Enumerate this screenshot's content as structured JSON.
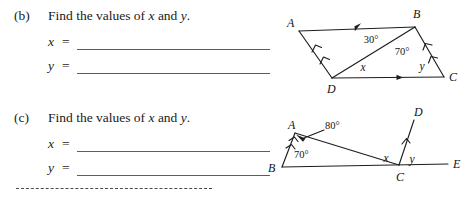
{
  "worksheet": {
    "questions": [
      {
        "id": "b",
        "label": "(b)",
        "prompt_before": "Find the values of ",
        "prompt_var1": "x",
        "prompt_mid": " and ",
        "prompt_var2": "y",
        "prompt_end": ".",
        "answers": [
          {
            "var": "x",
            "equals": "=",
            "value": ""
          },
          {
            "var": "y",
            "equals": "=",
            "value": ""
          }
        ]
      },
      {
        "id": "c",
        "label": "(c)",
        "prompt_before": "Find the values of ",
        "prompt_var1": "x",
        "prompt_mid": " and ",
        "prompt_var2": "y",
        "prompt_end": ".",
        "answers": [
          {
            "var": "x",
            "equals": "=",
            "value": ""
          },
          {
            "var": "y",
            "equals": "=",
            "value": ""
          }
        ]
      }
    ],
    "separator": "dashed-rule"
  },
  "figures": {
    "parallelogram": {
      "name": "parallelogram-abcd-with-diagonal",
      "vertices": [
        {
          "name": "A",
          "label": "A",
          "x": 22,
          "y": 30
        },
        {
          "name": "B",
          "label": "B",
          "x": 138,
          "y": 26
        },
        {
          "name": "C",
          "label": "C",
          "x": 170,
          "y": 76
        },
        {
          "name": "D",
          "label": "D",
          "x": 55,
          "y": 78
        }
      ],
      "angles": [
        {
          "name": "angle-dbа-30",
          "label": "30°",
          "x": 92,
          "y": 44
        },
        {
          "name": "angle-dbc-70",
          "label": "70°",
          "x": 117,
          "y": 52
        }
      ],
      "unknowns": [
        {
          "name": "angle-x",
          "label": "x",
          "x": 87,
          "y": 69
        },
        {
          "name": "angle-y",
          "label": "y",
          "x": 146,
          "y": 68
        }
      ],
      "tickmarks": {
        "ab_single_arrow": 1,
        "dc_single_arrow": 1,
        "ad_double_arrow": 2,
        "bc_double_arrow": 2
      }
    },
    "triangle_line": {
      "name": "triangle-abc-with-ray-cd-on-line-be",
      "vertices": [
        {
          "name": "A",
          "label": "A",
          "x": 30,
          "y": 28
        },
        {
          "name": "B",
          "label": "B",
          "x": 19,
          "y": 72
        },
        {
          "name": "C",
          "label": "C",
          "x": 137,
          "y": 80
        },
        {
          "name": "D",
          "label": "D",
          "x": 155,
          "y": 16
        },
        {
          "name": "E",
          "label": "E",
          "x": 188,
          "y": 65
        }
      ],
      "angles": [
        {
          "name": "angle-a-80",
          "label": "80°",
          "x": 52,
          "y": 28
        },
        {
          "name": "angle-b-70",
          "label": "70°",
          "x": 32,
          "y": 58
        }
      ],
      "unknowns": [
        {
          "name": "angle-x",
          "label": "x",
          "x": 124,
          "y": 64
        },
        {
          "name": "angle-y",
          "label": "y",
          "x": 147,
          "y": 66
        }
      ]
    }
  },
  "colors": {
    "ink": "#1d1d1d",
    "rule": "#5d5d5d",
    "page": "#ffffff"
  }
}
